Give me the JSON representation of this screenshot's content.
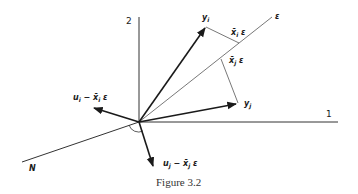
{
  "figure": {
    "caption": "Figure 3.2",
    "axes": {
      "axis1_label": "1",
      "axis2_label": "2",
      "epsilon_label": "ε",
      "n_label": "N"
    },
    "vectors": {
      "y_i": "y",
      "y_i_sub": "i",
      "y_j": "y",
      "y_j_sub": "j",
      "proj_i": "x̄",
      "proj_i_sub": "i",
      "proj_i_eps": " ε",
      "proj_j": "x̄",
      "proj_j_sub": "j",
      "proj_j_eps": " ε",
      "resid_i_u": "u",
      "resid_i_sub": "i",
      "resid_i_rest": " − x̄",
      "resid_i_sub2": "i",
      "resid_i_eps": " ε",
      "resid_j_u": "u",
      "resid_j_sub": "j",
      "resid_j_rest": " − x̄",
      "resid_j_sub2": "j",
      "resid_j_eps": " ε"
    }
  },
  "colors": {
    "ink": "#1a1a1a",
    "thin_line": "#555555",
    "background": "#ffffff"
  }
}
